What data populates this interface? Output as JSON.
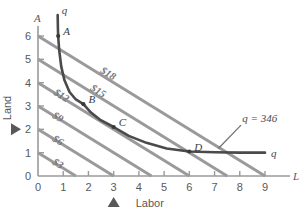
{
  "chart_data": {
    "type": "line",
    "title": "",
    "xlabel": "Labor",
    "ylabel": "Land",
    "x_axis_symbol": "L",
    "y_axis_symbol": "A",
    "xlim": [
      0,
      9.4
    ],
    "ylim": [
      0,
      6.6
    ],
    "xticks": [
      "0",
      "1",
      "2",
      "3",
      "4",
      "5",
      "6",
      "7",
      "8",
      "9"
    ],
    "yticks": [
      "0",
      "1",
      "2",
      "3",
      "4",
      "5",
      "6"
    ],
    "grid": false,
    "legend": "none",
    "series": [
      {
        "name": "isoquant",
        "label": "q",
        "annotation": "q = 346",
        "color": "#4a4a4c",
        "points": [
          [
            0.78,
            6.9
          ],
          [
            0.79,
            6.3
          ],
          [
            0.8,
            6.0
          ],
          [
            0.84,
            5.4
          ],
          [
            0.92,
            4.7
          ],
          [
            1.05,
            4.1
          ],
          [
            1.25,
            3.6
          ],
          [
            1.5,
            3.28
          ],
          [
            1.8,
            3.08
          ],
          [
            2.1,
            2.72
          ],
          [
            2.45,
            2.42
          ],
          [
            3.0,
            2.1
          ],
          [
            3.6,
            1.72
          ],
          [
            4.3,
            1.42
          ],
          [
            5.1,
            1.18
          ],
          [
            6.0,
            1.05
          ],
          [
            7.0,
            1.02
          ],
          [
            8.0,
            1.0
          ],
          [
            9.0,
            1.0
          ]
        ]
      }
    ],
    "isocosts": [
      {
        "label": "$3",
        "y_intercept": 1,
        "x_intercept": 1.5,
        "slope": -0.6667
      },
      {
        "label": "$6",
        "y_intercept": 2,
        "x_intercept": 3.0,
        "slope": -0.6667
      },
      {
        "label": "$9",
        "y_intercept": 3,
        "x_intercept": 4.5,
        "slope": -0.6667
      },
      {
        "label": "$12",
        "y_intercept": 4,
        "x_intercept": 6.0,
        "slope": -0.6667
      },
      {
        "label": "$15",
        "y_intercept": 5,
        "x_intercept": 7.5,
        "slope": -0.6667
      },
      {
        "label": "$18",
        "y_intercept": 6,
        "x_intercept": 9.0,
        "slope": -0.6667
      }
    ],
    "isocost_color": "#9a9a9d",
    "labeled_points": [
      {
        "label": "A",
        "x": 0.8,
        "y": 6.0
      },
      {
        "label": "B",
        "x": 1.8,
        "y": 3.08
      },
      {
        "label": "C",
        "x": 3.0,
        "y": 2.1
      },
      {
        "label": "D",
        "x": 6.0,
        "y": 1.05
      }
    ],
    "markers": [
      {
        "name": "x-axis-marker",
        "axis": "x",
        "value": 3
      },
      {
        "name": "y-axis-marker",
        "axis": "y",
        "value": 2
      }
    ],
    "axis_color": "#9a9a9d"
  }
}
